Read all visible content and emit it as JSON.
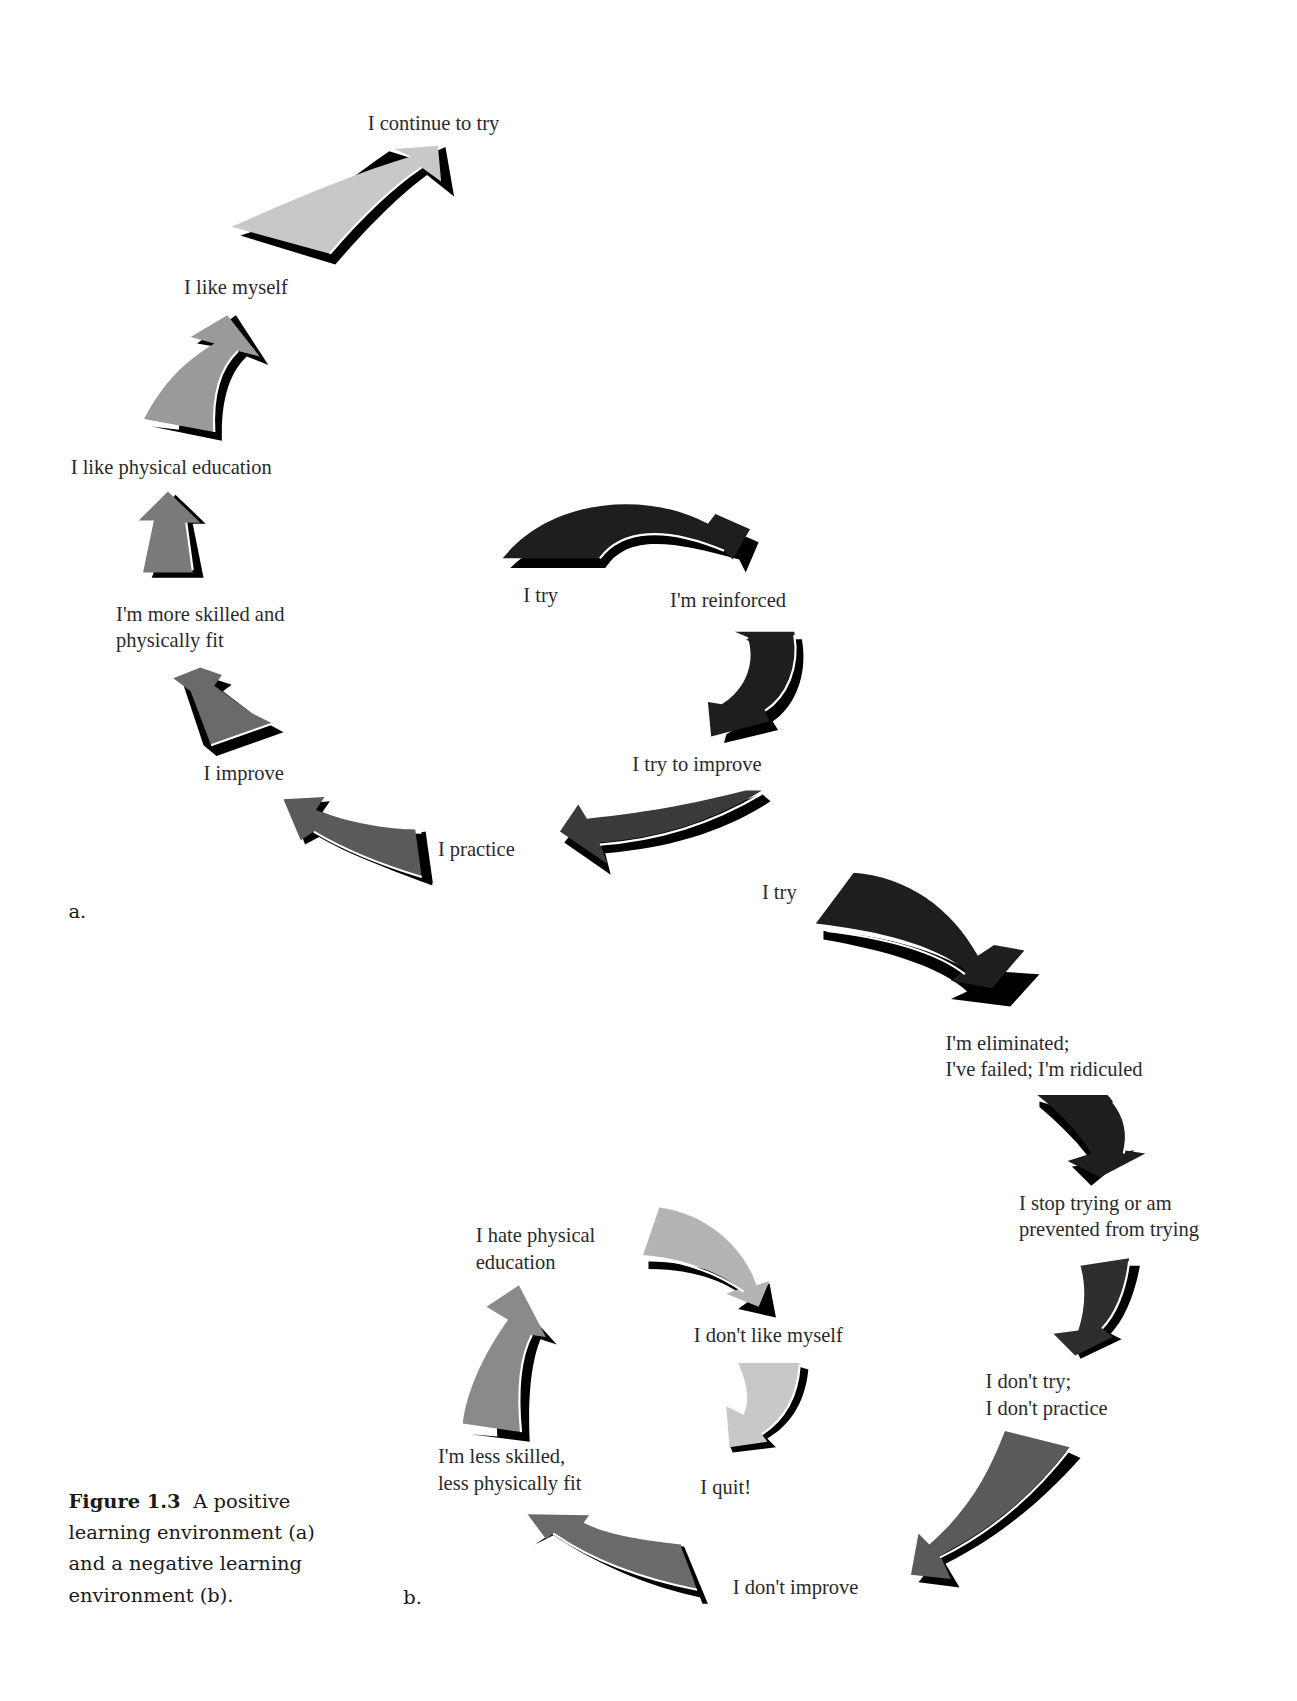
{
  "figure": {
    "number_label": "Figure 1.3",
    "caption_lines": [
      "A positive",
      "learning environment (a)",
      "and a negative learning",
      "environment (b)."
    ]
  },
  "panels": {
    "a": {
      "letter": "a.",
      "title": "Positive learning environment",
      "steps": [
        "I try",
        "I'm reinforced",
        "I try to improve",
        "I practice",
        "I improve",
        "I'm more skilled and physically fit",
        "I like physical education",
        "I like myself",
        "I continue to try"
      ],
      "labels": {
        "try": "I try",
        "reinforced": "I'm reinforced",
        "try_to_improve": "I try to improve",
        "practice": "I practice",
        "improve": "I improve",
        "more_skilled_1": "I'm more skilled and",
        "more_skilled_2": "physically fit",
        "like_pe": "I like physical education",
        "like_myself": "I like myself",
        "continue": "I continue to try"
      }
    },
    "b": {
      "letter": "b.",
      "title": "Negative learning environment",
      "steps": [
        "I try",
        "I'm eliminated; I've failed; I'm ridiculed",
        "I stop trying or am prevented from trying",
        "I don't try; I don't practice",
        "I don't improve",
        "I'm less skilled, less physically fit",
        "I hate physical education",
        "I don't like myself",
        "I quit!"
      ],
      "labels": {
        "try": "I try",
        "eliminated_1": "I'm eliminated;",
        "eliminated_2": "I've failed; I'm ridiculed",
        "stop_1": "I stop trying or am",
        "stop_2": "prevented from trying",
        "dont_try_1": "I don't try;",
        "dont_try_2": "I don't practice",
        "dont_improve": "I don't improve",
        "less_skilled_1": "I'm less skilled,",
        "less_skilled_2": "less physically fit",
        "hate_pe_1": "I hate physical",
        "hate_pe_2": "education",
        "dont_like_myself": "I don't like myself",
        "quit": "I quit!"
      }
    }
  },
  "colors": {
    "arrow_darkest": "#1e1e1e",
    "arrow_dark": "#3a3a3a",
    "arrow_mid": "#5a5a5a",
    "arrow_gray": "#7a7a7a",
    "arrow_light": "#9a9a9a",
    "arrow_lighter": "#b4b4b4",
    "arrow_lightest": "#c8c8c8",
    "shadow": "#000000",
    "text": "#2a2a2a"
  }
}
